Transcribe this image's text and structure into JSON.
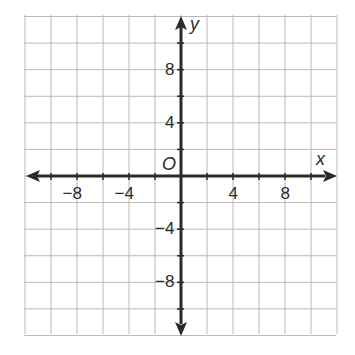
{
  "chart_data": {
    "type": "coordinate-grid",
    "title": "",
    "xlabel": "x",
    "ylabel": "y",
    "origin_label": "O",
    "xlim": [
      -12,
      12
    ],
    "ylim": [
      -12,
      12
    ],
    "grid": true,
    "grid_step": 2,
    "x_tick_labels": [
      {
        "value": -8,
        "label": "−8"
      },
      {
        "value": -4,
        "label": "−4"
      },
      {
        "value": 4,
        "label": "4"
      },
      {
        "value": 8,
        "label": "8"
      }
    ],
    "y_tick_labels": [
      {
        "value": 8,
        "label": "8"
      },
      {
        "value": 4,
        "label": "4"
      },
      {
        "value": -4,
        "label": "−4"
      },
      {
        "value": -8,
        "label": "−8"
      }
    ],
    "series": []
  },
  "colors": {
    "grid": "#b8b8b8",
    "axis": "#2a2a2a",
    "background": "#ffffff"
  }
}
